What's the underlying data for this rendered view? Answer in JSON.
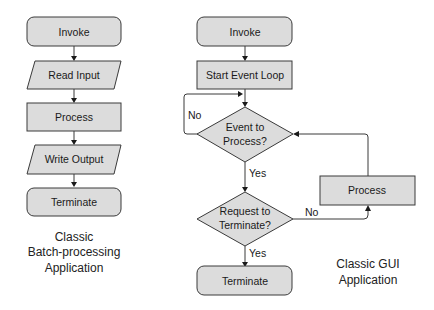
{
  "batch": {
    "invoke": "Invoke",
    "read_input": "Read Input",
    "process": "Process",
    "write_output": "Write Output",
    "terminate": "Terminate",
    "caption": [
      "Classic",
      "Batch-processing",
      "Application"
    ]
  },
  "gui": {
    "invoke": "Invoke",
    "start_event_loop": "Start Event Loop",
    "event_decision": [
      "Event to",
      "Process?"
    ],
    "request_decision": [
      "Request to",
      "Terminate?"
    ],
    "process": "Process",
    "terminate": "Terminate",
    "edge_no_loop": "No",
    "edge_yes_1": "Yes",
    "edge_no_2": "No",
    "edge_yes_2": "Yes",
    "caption": [
      "Classic GUI",
      "Application"
    ]
  },
  "colors": {
    "shape_fill": "#dcdcdc",
    "stroke": "#3a3a3a"
  }
}
